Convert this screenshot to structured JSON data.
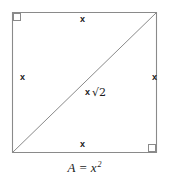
{
  "figure": {
    "shape": "square-with-diagonal",
    "stroke_color": "#8a8a8a",
    "text_color": "#1b1b1b",
    "background_color": "#ffffff",
    "square": {
      "left": 12,
      "top": 12,
      "right": 157,
      "bottom": 153
    },
    "diagonal": {
      "from": "bottom-left",
      "to": "top-right"
    },
    "right_angle_markers": [
      "top-left",
      "bottom-right"
    ],
    "labels": {
      "top": "x",
      "bottom": "x",
      "left": "x",
      "right": "x",
      "diagonal_var": "x",
      "diagonal_radical": "√2",
      "diagonal_full": "x √2"
    },
    "caption": {
      "area_symbol": "A",
      "equals": "=",
      "expression_base": "x",
      "expression_exponent": "2",
      "full": "A = x²"
    }
  }
}
